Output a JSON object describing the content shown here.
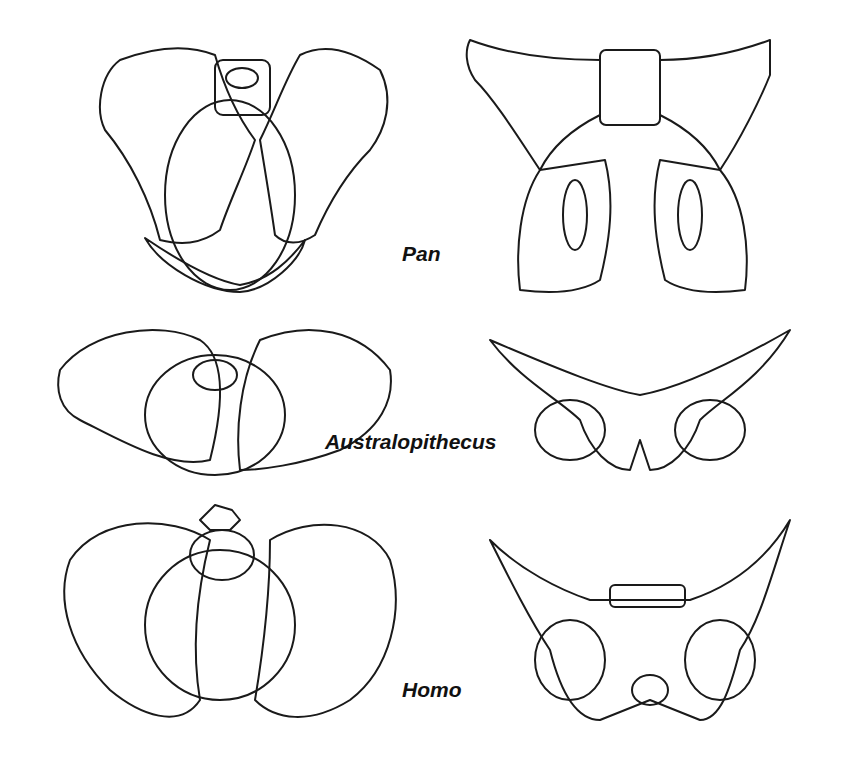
{
  "diagram": {
    "type": "comparative anatomy line drawings",
    "rows": [
      {
        "label": "Pan",
        "views": [
          "front pelvis",
          "rear pelvis"
        ]
      },
      {
        "label": "Australopithecus",
        "views": [
          "front pelvis",
          "rear pelvis"
        ]
      },
      {
        "label": "Homo",
        "views": [
          "front pelvis",
          "rear pelvis"
        ]
      }
    ],
    "colors": {
      "line": "#1a1a1a",
      "background": "#ffffff"
    }
  }
}
